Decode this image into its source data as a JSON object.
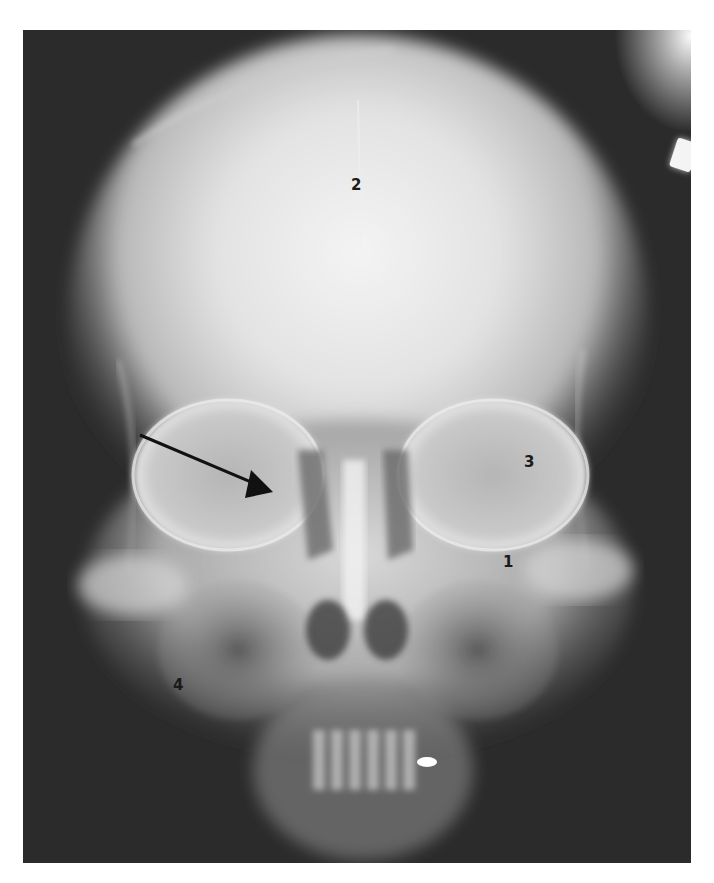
{
  "figure": {
    "type": "radiograph",
    "view": "frontal skull X-ray",
    "background_color": "#ffffff",
    "frame_color": "#2a2a2a",
    "labels": [
      {
        "id": "1",
        "text": "1",
        "x": 503,
        "y": 555
      },
      {
        "id": "2",
        "text": "2",
        "x": 351,
        "y": 178
      },
      {
        "id": "3",
        "text": "3",
        "x": 524,
        "y": 455
      },
      {
        "id": "4",
        "text": "4",
        "x": 173,
        "y": 678
      }
    ],
    "arrow": {
      "color": "#111111",
      "from": {
        "x": 140,
        "y": 435
      },
      "to": {
        "x": 270,
        "y": 490
      },
      "head": "filled-triangle"
    },
    "annotations": {
      "dental_restoration": "bright metallic filling near upper teeth",
      "marker": "bright rectangular marker at upper right edge"
    }
  }
}
